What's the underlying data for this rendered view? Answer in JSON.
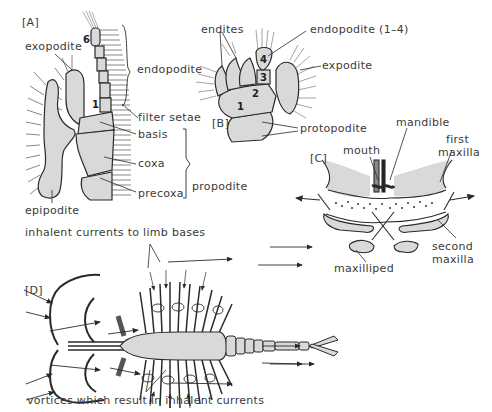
{
  "figure": {
    "panels": {
      "A": {
        "tag": "[A]",
        "labels": {
          "exopodite": "exopodite",
          "endopodite": "endopodite",
          "filter_setae": "filter setae",
          "basis": "basis",
          "coxa": "coxa",
          "precoxa": "precoxa",
          "propodite": "propodite",
          "epipodite": "epipodite"
        },
        "segment_numbers": {
          "top": "6",
          "bottom": "1"
        }
      },
      "B": {
        "tag": "[B]",
        "labels": {
          "endites": "endites",
          "endopodite": "endopodite (1–4)",
          "expodite": "expodite",
          "protopodite": "protopodite"
        },
        "segment_numbers": [
          "1",
          "2",
          "3",
          "4"
        ]
      },
      "C": {
        "tag": "[C]",
        "labels": {
          "mouth": "mouth",
          "mandible": "mandible",
          "first_maxilla_1": "first",
          "first_maxilla_2": "maxilla",
          "second_maxilla_1": "second",
          "second_maxilla_2": "maxilla",
          "maxilliped": "maxilliped"
        }
      },
      "D": {
        "tag": "[D]",
        "labels": {
          "inhalent_currents": "inhalent currents to limb bases",
          "vortices": "vortices which result in inhalent currents"
        }
      }
    },
    "colors": {
      "fill": "#d9d9d9",
      "stroke": "#2a2a2a",
      "text": "#3a3a3a"
    }
  }
}
